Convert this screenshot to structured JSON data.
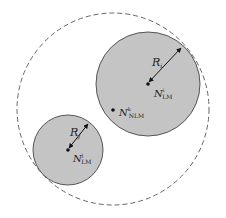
{
  "diagram": {
    "colors": {
      "disk_fill": "#c4c4c4",
      "disk_stroke": "#555555",
      "dashed_circle": "#666666",
      "arrow": "#111111",
      "background": "#ffffff"
    },
    "outer_region": {
      "cx": 113,
      "cy": 109,
      "r": 96,
      "style": "dashed"
    },
    "disks": [
      {
        "id": "large",
        "cx": 148,
        "cy": 84,
        "r": 52,
        "center_label": {
          "base": "N",
          "sub": "LM",
          "sup": "i"
        },
        "radius_label": {
          "base": "R",
          "sub": "i"
        },
        "arrow_end": [
          181,
          48
        ]
      },
      {
        "id": "small",
        "cx": 68,
        "cy": 150,
        "r": 35,
        "center_label": {
          "base": "N",
          "sub": "LM",
          "sup": "j"
        },
        "radius_label": {
          "base": "R",
          "sub": "j"
        },
        "arrow_end": [
          88,
          124
        ]
      }
    ],
    "nlm_point": {
      "x": 113,
      "y": 110,
      "label": {
        "base": "N",
        "sub": "NLM",
        "sup": "k"
      }
    }
  },
  "labels": {
    "large_R": "R",
    "large_R_sub": "i",
    "large_N": "N",
    "large_N_sub": "LM",
    "large_N_sup": "i",
    "small_R": "R",
    "small_R_sub": "j",
    "small_N": "N",
    "small_N_sub": "LM",
    "small_N_sup": "j",
    "nlm_N": "N",
    "nlm_N_sub": "NLM",
    "nlm_N_sup": "k"
  }
}
